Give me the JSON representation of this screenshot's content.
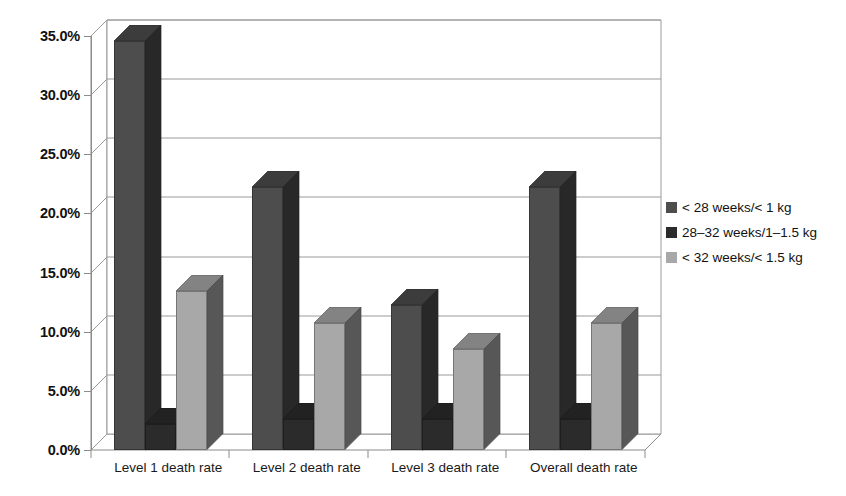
{
  "chart_data": {
    "type": "bar",
    "title": "",
    "subtitle": "",
    "xlabel": "",
    "ylabel": "",
    "categories": [
      "Level 1 death rate",
      "Level 2 death rate",
      "Level 3 death rate",
      "Overall death rate"
    ],
    "series": [
      {
        "name": "< 28 weeks/< 1 kg",
        "color": "#4d4d4d",
        "values": [
          34.6,
          22.2,
          12.3,
          22.2
        ]
      },
      {
        "name": "28–32 weeks/1–1.5 kg",
        "color": "#2b2b2b",
        "values": [
          2.2,
          2.6,
          2.6,
          2.6
        ]
      },
      {
        "name": "< 32 weeks/< 1.5 kg",
        "color": "#a8a8a8",
        "values": [
          13.4,
          10.7,
          8.5,
          10.7
        ]
      }
    ],
    "ylim": [
      0,
      35
    ],
    "ytick_values": [
      0,
      5,
      10,
      15,
      20,
      25,
      30,
      35
    ],
    "ytick_labels": [
      "0.0%",
      "5.0%",
      "10.0%",
      "15.0%",
      "20.0%",
      "25.0%",
      "30.0%",
      "35.0%"
    ],
    "grid": true,
    "legend_position": "right",
    "style": "3d-column"
  },
  "legend": {
    "entries": [
      {
        "label": "< 28 weeks/< 1 kg"
      },
      {
        "label": "28–32 weeks/1–1.5 kg"
      },
      {
        "label": "< 32 weeks/< 1.5 kg"
      }
    ]
  },
  "colors": {
    "series_1": "#4d4d4d",
    "series_2": "#2b2b2b",
    "series_3": "#a8a8a8",
    "axis": "#8b8b8b",
    "grid": "#9a9a9a",
    "background": "#ffffff",
    "text": "#111111"
  }
}
